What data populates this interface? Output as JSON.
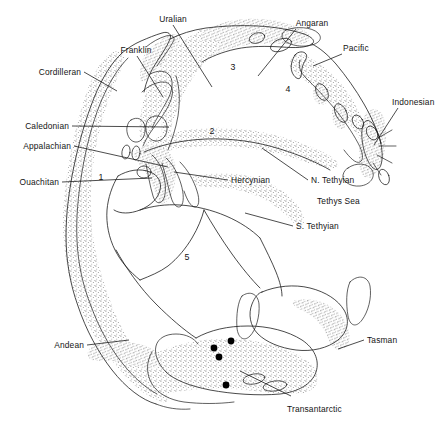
{
  "figure": {
    "kind": "paleogeographic-map"
  },
  "labels": {
    "cordilleran": "Cordilleran",
    "caledonian": "Caledonian",
    "appalachian": "Appalachian",
    "ouachitan": "Ouachitan",
    "franklin": "Franklin",
    "uralian": "Uralian",
    "angaran": "Angaran",
    "pacific": "Pacific",
    "indonesian": "Indonesian",
    "hercynian": "Hercynian",
    "n_tethyian": "N. Tethyian",
    "tethys_sea": "Tethys Sea",
    "s_tethyian": "S. Tethyian",
    "andean": "Andean",
    "tasman": "Tasman",
    "transantarctic": "Transantarctic"
  },
  "region_numbers": {
    "one": "1",
    "two": "2",
    "three": "3",
    "four": "4",
    "five": "5"
  },
  "colors": {
    "background": "#ffffff",
    "ink": "#1a1a1a",
    "stipple": "#555555",
    "marker": "#000000"
  },
  "markers": {
    "count": 4,
    "points": [
      {
        "x": 214,
        "y": 348
      },
      {
        "x": 231,
        "y": 341
      },
      {
        "x": 219,
        "y": 357
      },
      {
        "x": 226,
        "y": 385
      }
    ]
  }
}
